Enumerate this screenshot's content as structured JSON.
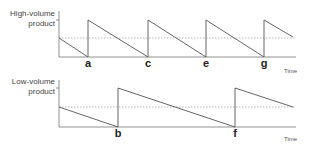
{
  "diagram": {
    "type": "sawtooth-inventory",
    "panels": [
      {
        "name": "high-volume",
        "ylabel_line1": "High-volume",
        "ylabel_line2": "product",
        "xlabel": "Time",
        "reorder_points": [
          "a",
          "c",
          "e",
          "g"
        ]
      },
      {
        "name": "low-volume",
        "ylabel_line1": "Low-volume",
        "ylabel_line2": "product",
        "xlabel": "Time",
        "reorder_points": [
          "b",
          "f"
        ]
      }
    ],
    "colors": {
      "line": "#555555",
      "dashed": "#888888",
      "axis": "#777777"
    }
  }
}
